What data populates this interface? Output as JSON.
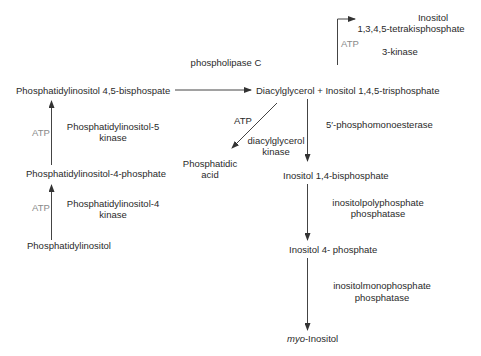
{
  "diagram": {
    "type": "metabolic-pathway",
    "colors": {
      "text": "#2a2a2a",
      "cofactor": "#8a8a8a",
      "arrow": "#333333",
      "background": "#ffffff"
    },
    "nodes": {
      "pip2": "Phosphatidylinositol 4,5-bisphospate",
      "pi4p": "Phosphatidylinositol-4-phosphate",
      "pi": "Phosphatidylinositol",
      "dag_ip3": "Diacylglycerol + Inositol 1,4,5-trisphosphate",
      "ip4_line1": "Inositol",
      "ip4_line2": "1,3,4,5-tetrakisphosphate",
      "pa_line1": "Phosphatidic",
      "pa_line2": "acid",
      "ip2": "Inositol 1,4-bisphosphate",
      "ip1": "Inositol 4- phosphate",
      "myo_prefix": "myo",
      "myo_suffix": "-Inositol"
    },
    "enzymes": {
      "plc": "phospholipase C",
      "pip5k_line1": "Phosphatidylinositol-5",
      "pip5k_line2": "kinase",
      "pi4k_line1": "Phosphatidylinositol-4",
      "pi4k_line2": "kinase",
      "ip3k": "3-kinase",
      "dgk_line1": "diacylglycerol",
      "dgk_line2": "kinase",
      "pme": "5′-phosphomonoesterase",
      "ipp_line1": "inositolpolyphosphate",
      "ipp_line2": "phosphatase",
      "imp_line1": "inositolmonophosphate",
      "imp_line2": "phosphatase"
    },
    "cofactors": {
      "atp_pip5k": "ATP",
      "atp_pi4k": "ATP",
      "atp_ip3k": "ATP",
      "atp_dgk": "ATP"
    }
  }
}
